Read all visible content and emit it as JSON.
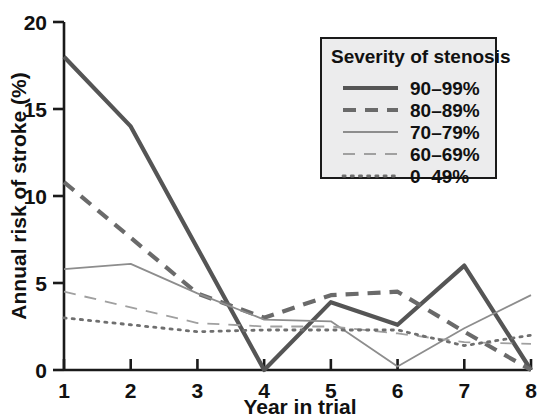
{
  "chart_data": {
    "type": "line",
    "title": "",
    "xlabel": "Year in trial",
    "ylabel": "Annual risk of stroke (%)",
    "x": [
      1,
      2,
      3,
      4,
      5,
      6,
      7,
      8
    ],
    "xlim": [
      1,
      8
    ],
    "ylim": [
      0,
      20
    ],
    "xticks": [
      "1",
      "2",
      "3",
      "4",
      "5",
      "6",
      "7",
      "8"
    ],
    "yticks": [
      "0",
      "5",
      "10",
      "15",
      "20"
    ],
    "grid": false,
    "legend_position": "top-right",
    "legend_title": "Severity of stenosis",
    "series": [
      {
        "name": "90–99%",
        "style": "solid-thick",
        "color": "#555555",
        "values": [
          18.0,
          14.0,
          7.0,
          0.0,
          3.9,
          2.6,
          6.0,
          0.0
        ]
      },
      {
        "name": "80–89%",
        "style": "dashed-thick",
        "color": "#6a6a6a",
        "values": [
          10.8,
          7.6,
          4.4,
          3.0,
          4.3,
          4.5,
          2.2,
          0.0
        ]
      },
      {
        "name": "70–79%",
        "style": "solid-thin",
        "color": "#8d8d8d",
        "values": [
          5.8,
          6.1,
          4.4,
          2.9,
          2.8,
          0.2,
          2.4,
          4.3
        ]
      },
      {
        "name": "60–69%",
        "style": "dashed-thin",
        "color": "#a0a0a0",
        "values": [
          4.5,
          3.6,
          2.7,
          2.5,
          2.5,
          2.1,
          1.6,
          1.5
        ]
      },
      {
        "name": "0–49%",
        "style": "dotted",
        "color": "#6f6f6f",
        "values": [
          3.0,
          2.6,
          2.2,
          2.3,
          2.3,
          2.3,
          1.4,
          2.0
        ]
      }
    ]
  },
  "axes": {
    "y_title": "Annual risk of stroke (%)",
    "x_title": "Year in trial"
  },
  "legend": {
    "title": "Severity of stenosis",
    "items": [
      {
        "label": "90–99%"
      },
      {
        "label": "80–89%"
      },
      {
        "label": "70–79%"
      },
      {
        "label": "60–69%"
      },
      {
        "label": "0–49%"
      }
    ]
  }
}
